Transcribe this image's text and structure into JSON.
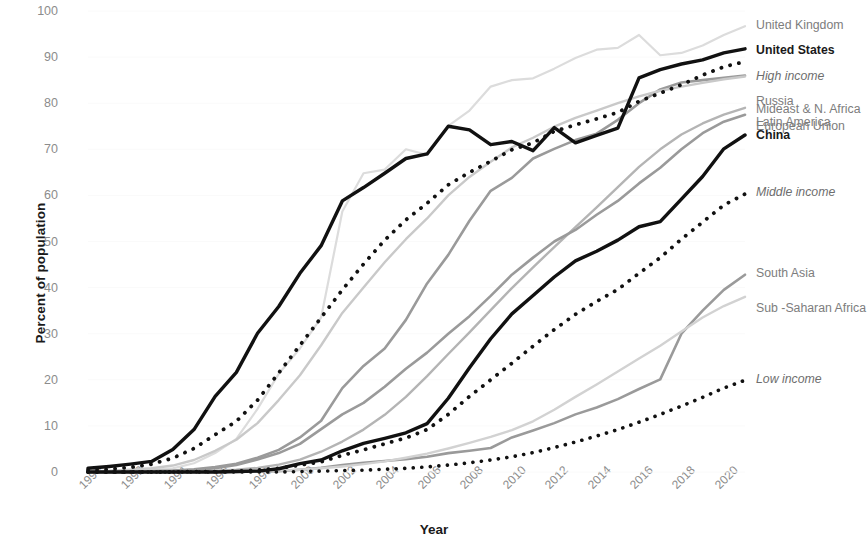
{
  "chart_data": {
    "type": "line",
    "title": "",
    "xlabel": "Year",
    "ylabel": "Percent of population",
    "xlim": [
      1990,
      2021
    ],
    "ylim": [
      0,
      100
    ],
    "grid": true,
    "legend_position": "right-inline-labels",
    "x_ticks": [
      "1990",
      "1992",
      "1994",
      "1996",
      "1998",
      "2000",
      "2002",
      "2004",
      "2006",
      "2008",
      "2010",
      "2012",
      "2014",
      "2016",
      "2018",
      "2020"
    ],
    "y_ticks": [
      "0",
      "10",
      "20",
      "30",
      "40",
      "50",
      "60",
      "70",
      "80",
      "90",
      "100"
    ],
    "x": [
      1990,
      1991,
      1992,
      1993,
      1994,
      1995,
      1996,
      1997,
      1998,
      1999,
      2000,
      2001,
      2002,
      2003,
      2004,
      2005,
      2006,
      2007,
      2008,
      2009,
      2010,
      2011,
      2012,
      2013,
      2014,
      2015,
      2016,
      2017,
      2018,
      2019,
      2020,
      2021
    ],
    "series": [
      {
        "name": "United Kingdom",
        "label": "United Kingdom",
        "style": "solid",
        "color": "#dcdcdc",
        "width": 2.2,
        "emphasis": "none",
        "label_y": 97,
        "values": [
          0.1,
          0.2,
          0.3,
          0.5,
          0.8,
          1.9,
          4.1,
          7.2,
          13.7,
          21.3,
          26.8,
          33.5,
          56.5,
          64.8,
          65.6,
          70.0,
          68.8,
          75.1,
          78.4,
          83.6,
          85.0,
          85.4,
          87.5,
          89.8,
          91.6,
          92.0,
          94.8,
          90.4,
          90.9,
          92.5,
          94.8,
          96.7
        ]
      },
      {
        "name": "United States",
        "label": "United States",
        "style": "solid",
        "color": "#111111",
        "width": 3.4,
        "emphasis": "bold",
        "label_y": 91.6,
        "values": [
          0.8,
          1.2,
          1.7,
          2.3,
          4.9,
          9.2,
          16.4,
          21.6,
          30.1,
          35.9,
          43.1,
          49.1,
          58.8,
          61.7,
          64.8,
          68.0,
          69.0,
          75.0,
          74.2,
          71.0,
          71.7,
          69.7,
          74.7,
          71.4,
          73.0,
          74.6,
          85.5,
          87.3,
          88.5,
          89.4,
          90.9,
          91.8
        ]
      },
      {
        "name": "High income",
        "label": "High income",
        "style": "dotted",
        "color": "#111111",
        "width": 3.8,
        "emphasis": "italic",
        "label_y": 86.0,
        "values": [
          0.4,
          0.6,
          1.0,
          1.7,
          3.0,
          5.1,
          8.1,
          11.0,
          15.6,
          21.5,
          27.5,
          33.5,
          39.5,
          45.1,
          50.3,
          54.7,
          58.3,
          62.3,
          65.0,
          67.4,
          69.9,
          71.4,
          73.9,
          75.3,
          76.6,
          78.0,
          80.4,
          82.2,
          84.0,
          86.1,
          87.9,
          89.0
        ]
      },
      {
        "name": "Russia",
        "label": "Russia",
        "style": "solid",
        "color": "#9a9a9a",
        "width": 2.6,
        "emphasis": "none",
        "label_y": 80.5,
        "values": [
          0.0,
          0.0,
          0.1,
          0.2,
          0.3,
          0.6,
          1.1,
          1.8,
          3.1,
          4.8,
          7.5,
          11.1,
          18.2,
          23.0,
          26.8,
          33.0,
          40.9,
          47.1,
          54.5,
          61.0,
          63.8,
          68.0,
          70.1,
          72.0,
          73.4,
          76.4,
          80.0,
          83.0,
          84.5,
          85.0,
          85.5,
          86.0
        ]
      },
      {
        "name": "European Union",
        "label": "European Union",
        "style": "solid",
        "color": "#c9c9c9",
        "width": 2.4,
        "emphasis": "none",
        "label_y": 75.0,
        "values": [
          0.2,
          0.3,
          0.5,
          0.8,
          1.4,
          2.6,
          4.6,
          7.0,
          10.6,
          15.6,
          21.0,
          27.5,
          34.5,
          40.0,
          45.5,
          50.5,
          55.0,
          60.0,
          64.0,
          67.3,
          70.4,
          72.5,
          74.9,
          76.8,
          78.4,
          80.0,
          81.5,
          82.7,
          83.6,
          84.4,
          85.2,
          85.8
        ]
      },
      {
        "name": "Mideast & N. Africa",
        "label": "Mideast & N. Africa",
        "style": "solid",
        "color": "#b4b4b4",
        "width": 2.4,
        "emphasis": "none",
        "label_y": 109.0,
        "values": [
          0.0,
          0.0,
          0.0,
          0.1,
          0.1,
          0.2,
          0.3,
          0.5,
          0.9,
          1.6,
          2.7,
          4.4,
          6.6,
          9.2,
          12.4,
          16.3,
          20.8,
          25.6,
          30.3,
          35.1,
          39.9,
          44.4,
          48.8,
          53.1,
          57.4,
          61.8,
          66.2,
          70.0,
          73.2,
          75.6,
          77.5,
          79.0
        ]
      },
      {
        "name": "Latin America",
        "label": "Latin America",
        "style": "solid",
        "color": "#9a9a9a",
        "width": 2.6,
        "emphasis": "none",
        "label_y": 122.0,
        "values": [
          0.0,
          0.0,
          0.1,
          0.1,
          0.2,
          0.4,
          0.8,
          1.5,
          2.7,
          4.1,
          6.1,
          9.3,
          12.5,
          15.0,
          18.5,
          22.4,
          25.9,
          30.0,
          33.8,
          38.2,
          42.8,
          46.5,
          50.0,
          52.5,
          55.8,
          58.8,
          62.6,
          66.0,
          70.0,
          73.5,
          76.0,
          77.5
        ]
      },
      {
        "name": "China",
        "label": "China",
        "style": "solid",
        "color": "#111111",
        "width": 3.4,
        "emphasis": "bold",
        "label_y": 135.0,
        "values": [
          0.0,
          0.0,
          0.0,
          0.0,
          0.0,
          0.0,
          0.0,
          0.1,
          0.2,
          0.7,
          1.8,
          2.6,
          4.6,
          6.2,
          7.3,
          8.5,
          10.5,
          16.0,
          22.6,
          28.9,
          34.3,
          38.3,
          42.3,
          45.8,
          47.9,
          50.3,
          53.2,
          54.3,
          59.2,
          64.1,
          70.1,
          73.1
        ]
      },
      {
        "name": "Middle income",
        "label": "Middle income",
        "style": "dotted",
        "color": "#111111",
        "width": 3.8,
        "emphasis": "italic",
        "label_y": 192.0,
        "values": [
          0.0,
          0.0,
          0.0,
          0.0,
          0.0,
          0.1,
          0.1,
          0.2,
          0.4,
          0.8,
          1.5,
          2.2,
          3.6,
          4.8,
          6.1,
          7.4,
          9.2,
          12.5,
          16.4,
          20.0,
          23.6,
          27.3,
          30.9,
          34.2,
          37.0,
          39.6,
          43.1,
          46.5,
          50.5,
          54.2,
          57.9,
          60.3
        ]
      },
      {
        "name": "South Asia",
        "label": "South Asia",
        "style": "solid",
        "color": "#9a9a9a",
        "width": 2.6,
        "emphasis": "none",
        "label_y": 273.0,
        "values": [
          0.0,
          0.0,
          0.0,
          0.0,
          0.0,
          0.0,
          0.0,
          0.0,
          0.1,
          0.2,
          0.5,
          0.9,
          1.5,
          2.0,
          2.4,
          2.8,
          3.3,
          4.1,
          4.6,
          5.2,
          7.5,
          9.0,
          10.6,
          12.5,
          14.0,
          15.8,
          18.0,
          20.1,
          30.0,
          35.0,
          39.5,
          42.8
        ]
      },
      {
        "name": "Sub-Saharan Africa",
        "label": "Sub -Saharan Africa",
        "style": "solid",
        "color": "#d2d2d2",
        "width": 2.4,
        "emphasis": "none",
        "label_y": 308.0,
        "values": [
          0.0,
          0.0,
          0.0,
          0.0,
          0.0,
          0.0,
          0.1,
          0.1,
          0.2,
          0.3,
          0.5,
          0.8,
          1.2,
          1.7,
          2.3,
          3.1,
          4.0,
          5.1,
          6.3,
          7.6,
          9.1,
          11.0,
          13.5,
          16.3,
          19.0,
          21.8,
          24.6,
          27.4,
          30.5,
          33.5,
          36.0,
          38.0
        ]
      },
      {
        "name": "Low income",
        "label": "Low income",
        "style": "dotted",
        "color": "#111111",
        "width": 3.6,
        "emphasis": "italic",
        "label_y": 379.0,
        "values": [
          0.0,
          0.0,
          0.0,
          0.0,
          0.0,
          0.0,
          0.0,
          0.0,
          0.0,
          0.0,
          0.1,
          0.2,
          0.3,
          0.4,
          0.6,
          0.8,
          1.1,
          1.5,
          2.0,
          2.6,
          3.3,
          4.2,
          5.3,
          6.5,
          7.8,
          9.2,
          10.8,
          12.5,
          14.3,
          16.2,
          18.2,
          19.9
        ]
      }
    ]
  }
}
